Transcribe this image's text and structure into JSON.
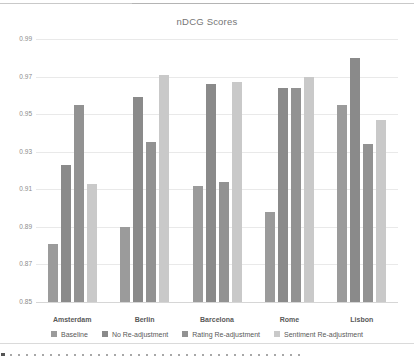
{
  "chart_data": {
    "type": "bar",
    "title": "nDCG Scores",
    "categories": [
      "Amsterdam",
      "Berlin",
      "Barcelona",
      "Rome",
      "Lisbon"
    ],
    "series": [
      {
        "name": "Baseline",
        "color": "#9b9b9b",
        "values": [
          0.881,
          0.89,
          0.912,
          0.898,
          0.955
        ]
      },
      {
        "name": "No Re-adjustment",
        "color": "#8a8a8a",
        "values": [
          0.923,
          0.959,
          0.966,
          0.964,
          0.98
        ]
      },
      {
        "name": "Rating Re-adjustment",
        "color": "#929292",
        "values": [
          0.955,
          0.935,
          0.914,
          0.964,
          0.934
        ]
      },
      {
        "name": "Sentiment Re-adjustment",
        "color": "#c9c9c9",
        "values": [
          0.913,
          0.971,
          0.967,
          0.97,
          0.947
        ]
      }
    ],
    "ylim": [
      0.85,
      0.99
    ],
    "ytick_step": 0.02,
    "ytick_labels": [
      "0.99",
      "0.97",
      "0.95",
      "0.93",
      "0.91",
      "0.89",
      "0.87",
      "0.85"
    ],
    "grid": true,
    "legend_position": "bottom",
    "axis_color": "#d6d6d6",
    "gridline_color": "#e9e9e9"
  }
}
